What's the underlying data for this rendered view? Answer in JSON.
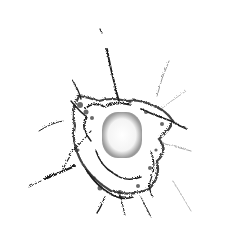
{
  "image": {
    "subject": "bullet hole in glass with radiating cracks",
    "background_color": "#ffffff",
    "crack_color": "#1a1a1a",
    "hole_center": [
      122,
      132
    ],
    "hole_radius": 18
  }
}
